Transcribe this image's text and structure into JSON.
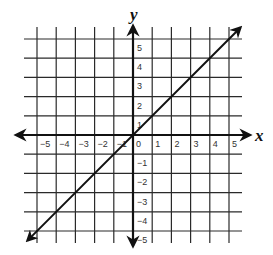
{
  "chart_data": {
    "type": "line",
    "title": "",
    "xlabel": "x",
    "ylabel": "y",
    "xlim": [
      -5,
      5
    ],
    "ylim": [
      -5,
      5
    ],
    "grid": true,
    "x_ticks": [
      "-5",
      "-4",
      "-3",
      "-2",
      "-1",
      "0",
      "1",
      "2",
      "3",
      "4",
      "5"
    ],
    "y_ticks": [
      "5",
      "4",
      "3",
      "2",
      "1",
      "-1",
      "-2",
      "-3",
      "-4",
      "-5"
    ],
    "series": [
      {
        "name": "y = x",
        "x": [
          -5,
          -4,
          -3,
          -2,
          -1,
          0,
          1,
          2,
          3,
          4,
          5
        ],
        "y": [
          -5,
          -4,
          -3,
          -2,
          -1,
          0,
          1,
          2,
          3,
          4,
          5
        ],
        "arrows": "both"
      }
    ],
    "colors": {
      "grid": "#2a2a2a",
      "axis": "#111111",
      "line": "#111111",
      "background": "#ffffff"
    }
  },
  "labels": {
    "x_axis": "x",
    "y_axis": "y"
  }
}
